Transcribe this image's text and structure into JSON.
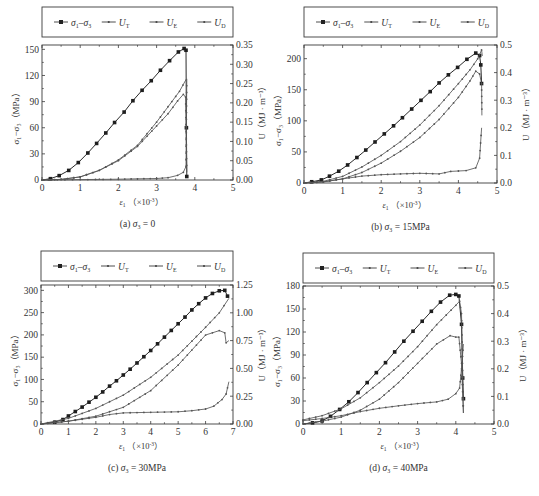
{
  "legend": {
    "items": [
      {
        "key": "sd",
        "label_main": "σ",
        "label_sub1": "1",
        "dash": "–",
        "label_main2": "σ",
        "label_sub2": "3",
        "marker": "square"
      },
      {
        "key": "ut",
        "label_main": "U",
        "label_sub1": "T",
        "marker": "dot"
      },
      {
        "key": "ue",
        "label_main": "U",
        "label_sub1": "E",
        "marker": "dot"
      },
      {
        "key": "ud",
        "label_main": "U",
        "label_sub1": "D",
        "marker": "dot"
      }
    ]
  },
  "axis_text": {
    "xlabel_main": "ε",
    "xlabel_sub": "1",
    "xlabel_unit": "（×10",
    "xlabel_exp": "-3",
    "xlabel_close": "）",
    "ylabel_left": "σ₁−σ₃（MPa）",
    "ylabel_right": "U（MJ · m⁻³）"
  },
  "chart_data": [
    {
      "id": "a",
      "type": "line",
      "caption": "(a) σ3 = 0",
      "caption_prefix": "(a) ",
      "caption_var": "σ",
      "caption_sub": "3",
      "caption_value": " = 0",
      "xlabel": "ε1 (×10^-3)",
      "ylabel": "σ1−σ3 (MPa)",
      "y2label": "U (MJ·m^-3)",
      "xlim": [
        0,
        5
      ],
      "ylim": [
        0,
        155
      ],
      "y2lim": [
        0,
        0.35
      ],
      "xticks": [
        0,
        1,
        2,
        3,
        4,
        5
      ],
      "yticks": [
        0,
        30,
        60,
        90,
        120,
        150
      ],
      "y2ticks": [
        "0.00",
        "0.05",
        "0.10",
        "0.15",
        "0.20",
        "0.25",
        "0.30",
        "0.35"
      ],
      "grid": false,
      "legend_position": "top-outside",
      "box": {
        "x": 42,
        "y": 45,
        "w": 191,
        "h": 135
      },
      "legend_box": {
        "x": 42,
        "y": 7,
        "w": 191,
        "h": 30
      },
      "series": [
        {
          "name": "σ1−σ3",
          "axis": "left",
          "marker": "square",
          "x": [
            0,
            0.22,
            0.45,
            0.7,
            0.95,
            1.2,
            1.43,
            1.67,
            1.9,
            2.15,
            2.38,
            2.62,
            2.86,
            3.1,
            3.34,
            3.57,
            3.72,
            3.77,
            3.78,
            3.79
          ],
          "y": [
            0,
            1.5,
            5,
            11,
            20,
            31,
            42,
            54,
            66,
            78,
            91,
            103,
            114,
            126,
            137,
            147,
            151,
            149,
            60,
            4
          ]
        },
        {
          "name": "UT",
          "axis": "right",
          "marker": "dot",
          "x": [
            0,
            0.5,
            1.0,
            1.5,
            2.0,
            2.5,
            3.0,
            3.3,
            3.6,
            3.78
          ],
          "y": [
            0,
            0.0015,
            0.008,
            0.025,
            0.052,
            0.09,
            0.15,
            0.19,
            0.23,
            0.262
          ]
        },
        {
          "name": "UE",
          "axis": "right",
          "marker": "dot",
          "x": [
            0,
            0.5,
            1.0,
            1.5,
            2.0,
            2.5,
            3.0,
            3.3,
            3.55,
            3.7,
            3.76,
            3.79
          ],
          "y": [
            0,
            0.0015,
            0.008,
            0.025,
            0.05,
            0.087,
            0.14,
            0.172,
            0.205,
            0.222,
            0.215,
            0.02
          ]
        },
        {
          "name": "UD",
          "axis": "right",
          "marker": "dot",
          "x": [
            0,
            1.0,
            2.0,
            2.5,
            3.0,
            3.3,
            3.55,
            3.7,
            3.77,
            3.79
          ],
          "y": [
            0,
            0.001,
            0.002,
            0.003,
            0.004,
            0.006,
            0.012,
            0.02,
            0.035,
            0.262
          ]
        }
      ]
    },
    {
      "id": "b",
      "type": "line",
      "caption": "(b) σ3 = 15MPa",
      "caption_prefix": "(b) ",
      "caption_var": "σ",
      "caption_sub": "3",
      "caption_value": " = 15MPa",
      "xlabel": "ε1 (×10^-3)",
      "ylabel": "σ1−σ3 (MPa)",
      "y2label": "U (MJ·m^-3)",
      "xlim": [
        0,
        5
      ],
      "ylim": [
        0,
        222
      ],
      "y2lim": [
        0,
        0.5
      ],
      "xticks": [
        0,
        1,
        2,
        3,
        4,
        5
      ],
      "yticks": [
        0,
        50,
        100,
        150,
        200
      ],
      "y2ticks": [
        "0.0",
        "0.1",
        "0.2",
        "0.3",
        "0.4",
        "0.5"
      ],
      "grid": false,
      "legend_position": "top-outside",
      "box": {
        "x": 304,
        "y": 45,
        "w": 193,
        "h": 138
      },
      "legend_box": {
        "x": 304,
        "y": 7,
        "w": 193,
        "h": 30
      },
      "series": [
        {
          "name": "σ1−σ3",
          "axis": "left",
          "marker": "square",
          "x": [
            0,
            0.2,
            0.45,
            0.66,
            0.9,
            1.13,
            1.37,
            1.6,
            1.84,
            2.08,
            2.32,
            2.55,
            2.79,
            3.03,
            3.27,
            3.5,
            3.74,
            3.98,
            4.22,
            4.45,
            4.55,
            4.58,
            4.6
          ],
          "y": [
            0,
            2,
            5,
            11,
            19,
            29,
            41,
            53,
            66,
            79,
            92,
            105,
            119,
            133,
            147,
            161,
            174,
            186,
            199,
            209,
            205,
            190,
            160
          ]
        },
        {
          "name": "UT",
          "axis": "right",
          "marker": "dot",
          "x": [
            0,
            0.5,
            1.0,
            1.5,
            2.0,
            2.5,
            3.0,
            3.5,
            4.0,
            4.3,
            4.5,
            4.6,
            4.62
          ],
          "y": [
            0,
            0.006,
            0.024,
            0.058,
            0.1,
            0.15,
            0.21,
            0.28,
            0.36,
            0.41,
            0.45,
            0.482,
            0.46
          ]
        },
        {
          "name": "UE",
          "axis": "right",
          "marker": "dot",
          "x": [
            0,
            0.5,
            1.0,
            1.5,
            2.0,
            2.5,
            3.0,
            3.5,
            4.0,
            4.3,
            4.45,
            4.55,
            4.6,
            4.61
          ],
          "y": [
            0,
            0.004,
            0.015,
            0.038,
            0.072,
            0.115,
            0.165,
            0.23,
            0.31,
            0.37,
            0.405,
            0.395,
            0.36,
            0.245
          ]
        },
        {
          "name": "UD",
          "axis": "right",
          "marker": "dot",
          "x": [
            0,
            0.5,
            1.0,
            1.5,
            2.0,
            2.5,
            3.0,
            3.5,
            3.8,
            4.2,
            4.45,
            4.55,
            4.6
          ],
          "y": [
            0,
            0.004,
            0.015,
            0.025,
            0.03,
            0.033,
            0.035,
            0.033,
            0.042,
            0.045,
            0.055,
            0.09,
            0.2
          ]
        }
      ]
    },
    {
      "id": "c",
      "type": "line",
      "caption": "(c) σ3 = 30MPa",
      "caption_prefix": "(c) ",
      "caption_var": "σ",
      "caption_sub": "3",
      "caption_value": " = 30MPa",
      "xlabel": "ε1 (×10^-3)",
      "ylabel": "σ1−σ3 (MPa)",
      "y2label": "U (MJ·m^-3)",
      "xlim": [
        0,
        7
      ],
      "ylim": [
        0,
        312
      ],
      "y2lim": [
        0,
        1.25
      ],
      "xticks": [
        0,
        1,
        2,
        3,
        4,
        5,
        6,
        7
      ],
      "yticks": [
        0,
        50,
        100,
        150,
        200,
        250,
        300
      ],
      "y2ticks": [
        "0.00",
        "0.25",
        "0.50",
        "0.75",
        "1.00",
        "1.25"
      ],
      "grid": false,
      "legend_position": "top-outside",
      "box": {
        "x": 41,
        "y": 285,
        "w": 192,
        "h": 139
      },
      "legend_box": {
        "x": 41,
        "y": 251,
        "w": 192,
        "h": 30
      },
      "series": [
        {
          "name": "σ1−σ3",
          "axis": "left",
          "marker": "square",
          "x": [
            0,
            0.5,
            0.8,
            1.0,
            1.25,
            1.5,
            1.75,
            2.0,
            2.25,
            2.5,
            2.75,
            3.0,
            3.25,
            3.5,
            3.75,
            4.0,
            4.25,
            4.5,
            4.75,
            5.0,
            5.25,
            5.5,
            5.75,
            6.0,
            6.25,
            6.5,
            6.7,
            6.8
          ],
          "y": [
            0,
            4,
            10,
            18,
            28,
            38,
            49,
            60,
            72,
            85,
            97,
            110,
            123,
            137,
            151,
            165,
            180,
            195,
            210,
            225,
            240,
            256,
            270,
            283,
            293,
            299,
            300,
            287
          ]
        },
        {
          "name": "UT",
          "axis": "right",
          "marker": "dot",
          "x": [
            0,
            1.0,
            2.0,
            3.0,
            4.0,
            5.0,
            6.0,
            6.5,
            6.85
          ],
          "y": [
            0,
            0.05,
            0.14,
            0.26,
            0.42,
            0.62,
            0.87,
            1.0,
            1.13
          ]
        },
        {
          "name": "UE",
          "axis": "right",
          "marker": "dot",
          "x": [
            0,
            1.0,
            2.0,
            3.0,
            4.0,
            5.0,
            6.0,
            6.5,
            6.7,
            6.75,
            6.85
          ],
          "y": [
            0,
            0.025,
            0.07,
            0.15,
            0.3,
            0.53,
            0.8,
            0.84,
            0.82,
            0.73,
            0.75
          ]
        },
        {
          "name": "UD",
          "axis": "right",
          "marker": "dot",
          "x": [
            0,
            1.0,
            2.0,
            2.5,
            3.0,
            4.0,
            5.0,
            5.5,
            6.0,
            6.3,
            6.6,
            6.75,
            6.85
          ],
          "y": [
            0,
            0.025,
            0.06,
            0.085,
            0.1,
            0.105,
            0.11,
            0.12,
            0.135,
            0.16,
            0.22,
            0.27,
            0.38
          ]
        }
      ]
    },
    {
      "id": "d",
      "type": "line",
      "caption": "(d) σ3 = 40MPa",
      "caption_prefix": "(d) ",
      "caption_var": "σ",
      "caption_sub": "3",
      "caption_value": " = 40MPa",
      "xlabel": "ε1 (×10^-3)",
      "ylabel": "σ1−σ3 (MPa)",
      "y2label": "U (MJ·m^-3)",
      "xlim": [
        0,
        5
      ],
      "ylim": [
        0,
        180
      ],
      "y2lim": [
        0,
        0.5
      ],
      "xticks": [
        0,
        1,
        2,
        3,
        4,
        5
      ],
      "yticks": [
        0,
        30,
        60,
        90,
        120,
        150,
        180
      ],
      "y2ticks": [
        "0.0",
        "0.1",
        "0.2",
        "0.3",
        "0.4",
        "0.5"
      ],
      "grid": false,
      "legend_position": "top-outside",
      "box": {
        "x": 303,
        "y": 286,
        "w": 191,
        "h": 138
      },
      "legend_box": {
        "x": 303,
        "y": 253,
        "w": 191,
        "h": 30
      },
      "series": [
        {
          "name": "σ1−σ3",
          "axis": "left",
          "marker": "square",
          "x": [
            0,
            0.25,
            0.5,
            0.72,
            0.96,
            1.2,
            1.44,
            1.68,
            1.92,
            2.16,
            2.4,
            2.64,
            2.88,
            3.12,
            3.36,
            3.6,
            3.84,
            4.0,
            4.08,
            4.15,
            4.18,
            4.2
          ],
          "y": [
            0,
            1.5,
            4,
            10,
            19,
            29,
            41,
            54,
            67,
            80,
            94,
            108,
            121,
            134,
            147,
            159,
            168,
            169,
            167,
            130,
            60,
            33
          ]
        },
        {
          "name": "UT",
          "axis": "right",
          "marker": "dot",
          "x": [
            0,
            0.5,
            1.0,
            1.5,
            2.0,
            2.5,
            3.0,
            3.5,
            4.0,
            4.1,
            4.15,
            4.2
          ],
          "y": [
            0.015,
            0.03,
            0.055,
            0.095,
            0.15,
            0.21,
            0.28,
            0.36,
            0.43,
            0.445,
            0.4,
            0.04
          ]
        },
        {
          "name": "UE",
          "axis": "right",
          "marker": "dot",
          "x": [
            0,
            0.5,
            1.0,
            1.5,
            2.0,
            2.5,
            3.0,
            3.5,
            3.85,
            4.0,
            4.08,
            4.15,
            4.2
          ],
          "y": [
            0,
            0.01,
            0.025,
            0.05,
            0.09,
            0.15,
            0.22,
            0.29,
            0.32,
            0.315,
            0.315,
            0.22,
            0.04
          ]
        },
        {
          "name": "UD",
          "axis": "right",
          "marker": "dot",
          "x": [
            0,
            0.5,
            1.0,
            1.5,
            2.0,
            2.5,
            3.0,
            3.5,
            3.8,
            4.0,
            4.1,
            4.15,
            4.2
          ],
          "y": [
            0.012,
            0.02,
            0.03,
            0.045,
            0.057,
            0.066,
            0.074,
            0.08,
            0.09,
            0.11,
            0.13,
            0.2,
            0.29
          ]
        }
      ]
    }
  ]
}
